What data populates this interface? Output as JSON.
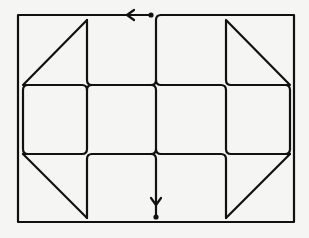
{
  "diagram": {
    "title": "Line-path puzzle diagram",
    "colors": {
      "background": "#f5f5f3",
      "line": "#111111"
    },
    "frame": {
      "x": 18,
      "y": 15,
      "width": 276,
      "height": 207
    },
    "grid": {
      "columns_x": [
        87,
        156,
        226
      ],
      "rows_y": [
        85,
        154
      ]
    },
    "triangles": [
      {
        "name": "top-left",
        "points": [
          [
            87,
            20
          ],
          [
            23,
            85
          ],
          [
            87,
            85
          ]
        ]
      },
      {
        "name": "top-right",
        "points": [
          [
            226,
            20
          ],
          [
            290,
            85
          ],
          [
            226,
            85
          ]
        ]
      },
      {
        "name": "bottom-left",
        "points": [
          [
            23,
            154
          ],
          [
            87,
            154
          ],
          [
            87,
            218
          ]
        ]
      },
      {
        "name": "bottom-right",
        "points": [
          [
            290,
            154
          ],
          [
            226,
            154
          ],
          [
            226,
            218
          ]
        ]
      }
    ],
    "start_marker": {
      "x": 151,
      "y": 15,
      "arrow_direction": "left",
      "arrow_x": 128
    },
    "end_marker": {
      "x": 156,
      "y": 217,
      "arrow_direction": "down",
      "arrow_y": 203
    }
  }
}
